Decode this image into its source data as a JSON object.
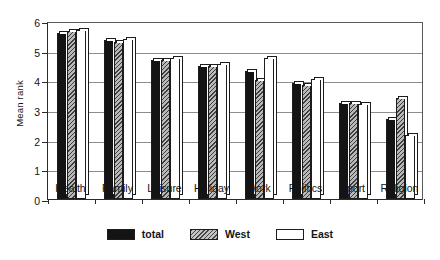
{
  "chart_data": {
    "type": "bar",
    "title": "",
    "xlabel": "",
    "ylabel": "Mean rank",
    "ylim": [
      0,
      6
    ],
    "yticks": [
      0,
      1,
      2,
      3,
      4,
      5,
      6
    ],
    "grid": true,
    "legend_position": "bottom-center",
    "categories": [
      "Health",
      "Family",
      "Leisure",
      "Holiday",
      "Work",
      "Politics",
      "Sport",
      "Religion"
    ],
    "series": [
      {
        "name": "total",
        "style": "solid-black",
        "color": "#141414",
        "values": [
          5.6,
          5.35,
          4.7,
          4.5,
          4.3,
          3.9,
          3.25,
          2.7
        ]
      },
      {
        "name": "West",
        "style": "gray-hatched",
        "color": "#b9b9b9",
        "values": [
          5.65,
          5.3,
          4.7,
          4.5,
          4.0,
          3.85,
          3.25,
          3.4
        ]
      },
      {
        "name": "East",
        "style": "white-outline",
        "color": "#ffffff",
        "values": [
          5.7,
          5.4,
          4.75,
          4.55,
          4.75,
          4.05,
          3.2,
          2.15
        ]
      }
    ]
  },
  "axis": {
    "y_title": "Mean rank"
  },
  "legend": {
    "entries": [
      {
        "label": "total"
      },
      {
        "label": "West"
      },
      {
        "label": "East"
      }
    ]
  }
}
